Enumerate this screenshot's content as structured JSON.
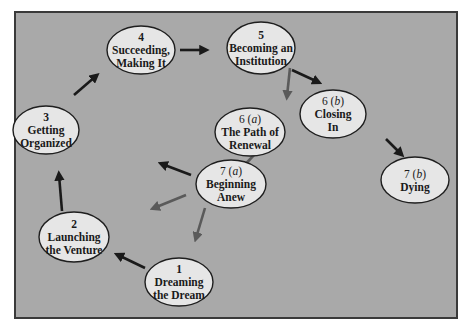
{
  "diagram": {
    "nodes": [
      {
        "id": "1",
        "lines": [
          "1",
          "Dreaming",
          "the Dream"
        ]
      },
      {
        "id": "2",
        "lines": [
          "2",
          "Launching",
          "the Venture"
        ]
      },
      {
        "id": "3",
        "lines": [
          "3",
          "Getting",
          "Organized"
        ]
      },
      {
        "id": "4",
        "lines": [
          "4",
          "Succeeding,",
          "Making It"
        ]
      },
      {
        "id": "5",
        "lines": [
          "5",
          "Becoming an",
          "Institution"
        ]
      },
      {
        "id": "6a",
        "lines": [
          "6 (a)",
          "The Path of",
          "Renewal"
        ],
        "italic_letter": "a"
      },
      {
        "id": "6b",
        "lines": [
          "6 (b)",
          "Closing",
          "In"
        ],
        "italic_letter": "b"
      },
      {
        "id": "7a",
        "lines": [
          "7 (a)",
          "Beginning",
          "Anew"
        ],
        "italic_letter": "a"
      },
      {
        "id": "7b",
        "lines": [
          "7 (b)",
          "Dying"
        ],
        "italic_letter": "b"
      }
    ],
    "edges": [
      {
        "from": "1",
        "to": "2",
        "style": "dark"
      },
      {
        "from": "2",
        "to": "3",
        "style": "dark"
      },
      {
        "from": "3",
        "to": "4",
        "style": "dark"
      },
      {
        "from": "4",
        "to": "5",
        "style": "dark"
      },
      {
        "from": "5",
        "to": "6a",
        "style": "gray"
      },
      {
        "from": "5",
        "to": "6b",
        "style": "dark"
      },
      {
        "from": "6a",
        "to": "7a",
        "style": "gray"
      },
      {
        "from": "6b",
        "to": "7b",
        "style": "dark"
      },
      {
        "from": "7a",
        "to": "3",
        "style": "dark"
      },
      {
        "from": "7a",
        "to": "2",
        "style": "gray"
      },
      {
        "from": "7a",
        "to": "1",
        "style": "gray"
      }
    ],
    "colors": {
      "background": "#a9a9a9",
      "node_fill": "#e6e6e6",
      "arrow_dark": "#1a1a1a",
      "arrow_gray": "#5a5a5a"
    }
  }
}
